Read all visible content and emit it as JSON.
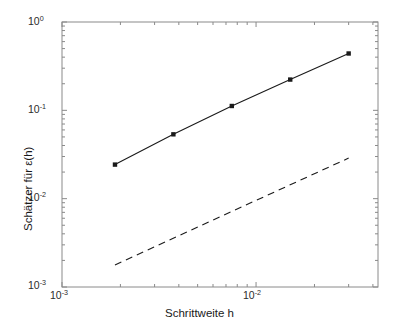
{
  "chart_data": {
    "type": "line",
    "title": "",
    "subtitle": "",
    "xlabel": "Schrittweite h",
    "ylabel": "Schätzer für ε(h)",
    "xscale": "log",
    "yscale": "log",
    "xlim": [
      0.001,
      0.0425
    ],
    "ylim": [
      0.001,
      1.0
    ],
    "grid": false,
    "legend": null,
    "x_tick_labels": [
      {
        "value": 0.001,
        "mantissa": "10",
        "exponent": "-3"
      },
      {
        "value": 0.01,
        "mantissa": "10",
        "exponent": "-2"
      }
    ],
    "y_tick_labels": [
      {
        "value": 1.0,
        "mantissa": "10",
        "exponent": "0"
      },
      {
        "value": 0.1,
        "mantissa": "10",
        "exponent": "-1"
      },
      {
        "value": 0.01,
        "mantissa": "10",
        "exponent": "-2"
      },
      {
        "value": 0.001,
        "mantissa": "10",
        "exponent": "-3"
      }
    ],
    "series": [
      {
        "name": "Schätzer für ε(h)",
        "style": "solid-with-markers",
        "marker": "square",
        "color": "#1a1a1a",
        "x": [
          0.001875,
          0.00375,
          0.0075,
          0.015,
          0.03
        ],
        "y": [
          0.0243,
          0.0535,
          0.112,
          0.223,
          0.44
        ]
      },
      {
        "name": "Referenzgerade",
        "style": "dashed",
        "marker": "none",
        "color": "#1a1a1a",
        "x": [
          0.001875,
          0.03
        ],
        "y": [
          0.00178,
          0.0288
        ]
      }
    ]
  }
}
